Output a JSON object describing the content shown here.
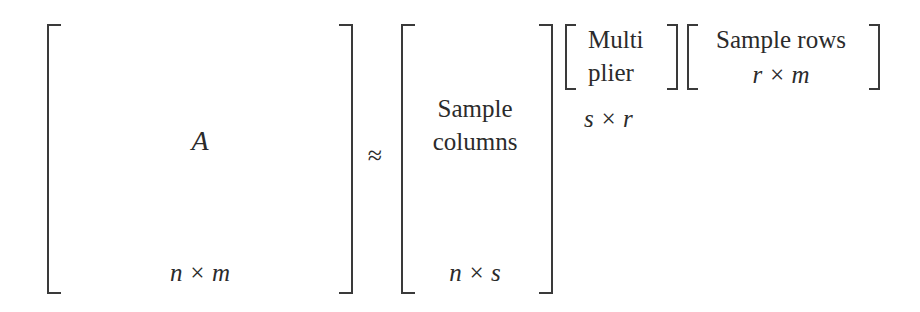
{
  "equation": {
    "approx_symbol": "≈",
    "matrix_a": {
      "label": "A",
      "dims": "n × m"
    },
    "sample_columns": {
      "line1": "Sample",
      "line2": "columns",
      "dims": "n × s"
    },
    "multiplier": {
      "line1": "Multi",
      "line2": "plier",
      "dims": "s × r"
    },
    "sample_rows": {
      "line1": "Sample rows",
      "dims": "r × m"
    }
  },
  "colors": {
    "ink": "#2b2b2b",
    "bracket": "#3a3a3a",
    "background": "#ffffff"
  }
}
